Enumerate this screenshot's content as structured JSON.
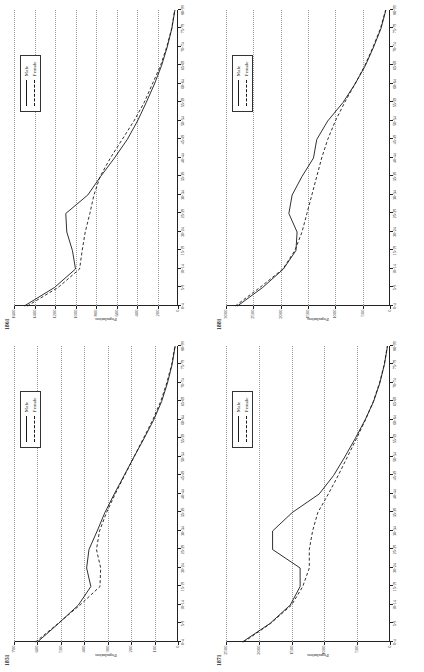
{
  "figure": {
    "panel_order": [
      "p1861",
      "p1881",
      "p1851",
      "p1871"
    ],
    "axis_y_title": "Population",
    "legend": {
      "male_label": "Male",
      "female_label": "Female"
    },
    "ink_color": "#1a1a1a",
    "grid_color": "#9a9a9a"
  },
  "chart_data": [
    {
      "id": "p1861",
      "type": "line",
      "title": "1861",
      "xlabel": "",
      "ylabel": "Population",
      "grid": true,
      "legend_position": "top-right",
      "ylim": [
        0,
        1600
      ],
      "yticks": [
        0,
        200,
        400,
        600,
        800,
        1000,
        1200,
        1400,
        1600
      ],
      "categories": [
        "0-4",
        "5-9",
        "10-14",
        "15-19",
        "20-24",
        "25-29",
        "30-34",
        "35-39",
        "40-44",
        "45-49",
        "50-54",
        "55-59",
        "60-64",
        "65-69",
        "70-74",
        "75-79",
        "80-99"
      ],
      "series": [
        {
          "name": "Male",
          "values": [
            1500,
            1205,
            1000,
            1030,
            1085,
            1095,
            880,
            755,
            620,
            495,
            395,
            310,
            230,
            160,
            105,
            60,
            30
          ]
        },
        {
          "name": "Female",
          "values": [
            1470,
            1170,
            960,
            935,
            905,
            860,
            820,
            760,
            660,
            545,
            430,
            330,
            250,
            170,
            110,
            62,
            32
          ]
        }
      ]
    },
    {
      "id": "p1881",
      "type": "line",
      "title": "1881",
      "xlabel": "",
      "ylabel": "Population",
      "grid": true,
      "legend_position": "top-right",
      "ylim": [
        0,
        3000
      ],
      "yticks": [
        0,
        500,
        1000,
        1500,
        2000,
        2500,
        3000
      ],
      "categories": [
        "0-4",
        "5-9",
        "10-14",
        "15-19",
        "20-24",
        "25-29",
        "30-34",
        "35-39",
        "40-44",
        "45-49",
        "50-54",
        "55-59",
        "60-64",
        "65-69",
        "70-74",
        "75-79",
        "80-99"
      ],
      "series": [
        {
          "name": "Male",
          "values": [
            2790,
            2330,
            1950,
            1720,
            1700,
            1850,
            1790,
            1610,
            1400,
            1340,
            1140,
            860,
            640,
            450,
            300,
            165,
            75
          ]
        },
        {
          "name": "Female",
          "values": [
            2830,
            2380,
            1960,
            1740,
            1610,
            1520,
            1430,
            1340,
            1250,
            1140,
            1000,
            830,
            640,
            460,
            310,
            175,
            80
          ]
        }
      ]
    },
    {
      "id": "p1851",
      "type": "line",
      "title": "1851",
      "xlabel": "",
      "ylabel": "Population",
      "grid": true,
      "legend_position": "top-right",
      "ylim": [
        0,
        700
      ],
      "yticks": [
        0,
        100,
        200,
        300,
        400,
        500,
        600,
        700
      ],
      "categories": [
        "0-4",
        "5-9",
        "10-14",
        "15-19",
        "20-24",
        "25-29",
        "30-34",
        "35-39",
        "40-44",
        "45-49",
        "50-54",
        "55-59",
        "60-64",
        "65-69",
        "70-74",
        "75-79",
        "80-99"
      ],
      "series": [
        {
          "name": "Male",
          "values": [
            600,
            510,
            425,
            372,
            390,
            380,
            345,
            312,
            272,
            230,
            188,
            145,
            104,
            70,
            45,
            25,
            12
          ]
        },
        {
          "name": "Female",
          "values": [
            608,
            512,
            418,
            333,
            330,
            348,
            335,
            305,
            268,
            228,
            188,
            148,
            108,
            74,
            48,
            27,
            13
          ]
        }
      ]
    },
    {
      "id": "p1871",
      "type": "line",
      "title": "1871",
      "xlabel": "",
      "ylabel": "Population",
      "grid": true,
      "legend_position": "top-right",
      "ylim": [
        0,
        2500
      ],
      "yticks": [
        0,
        500,
        1000,
        1500,
        2000,
        2500
      ],
      "categories": [
        "0-4",
        "5-9",
        "10-14",
        "15-19",
        "20-24",
        "25-29",
        "30-34",
        "35-39",
        "40-44",
        "45-49",
        "50-54",
        "55-59",
        "60-64",
        "65-69",
        "70-74",
        "75-79",
        "80-99"
      ],
      "series": [
        {
          "name": "Male",
          "values": [
            2250,
            1830,
            1520,
            1370,
            1370,
            1790,
            1790,
            1490,
            1080,
            860,
            690,
            530,
            380,
            250,
            155,
            85,
            38
          ]
        },
        {
          "name": "Female",
          "values": [
            2230,
            1820,
            1500,
            1330,
            1230,
            1230,
            1180,
            1100,
            940,
            790,
            650,
            510,
            375,
            255,
            160,
            88,
            40
          ]
        }
      ]
    }
  ]
}
